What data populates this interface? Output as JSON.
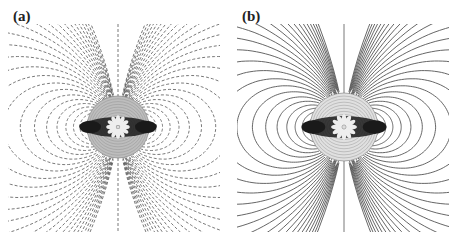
{
  "figure": {
    "panels": [
      {
        "id": "a",
        "label": "(a)",
        "line_style": "dashed",
        "center": [
          118,
          127
        ],
        "core_radius": 31,
        "core_fill": "#bdbdbd"
      },
      {
        "id": "b",
        "label": "(b)",
        "line_style": "solid",
        "center": [
          115,
          127
        ],
        "core_radius": 34,
        "core_fill": "#e0e0e0"
      }
    ],
    "colors": {
      "lines": "#555555",
      "core_dark": "#1a1a1a",
      "background": "#ffffff"
    }
  }
}
